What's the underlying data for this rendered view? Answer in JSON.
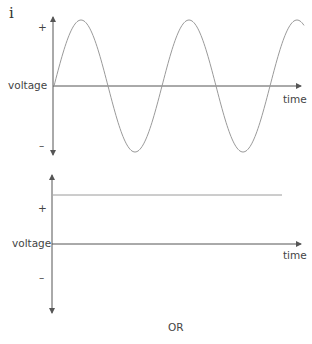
{
  "part_label": "i",
  "separator_label": "OR",
  "colors": {
    "axis": "#555555",
    "curve": "#9a9a9a",
    "text": "#444444"
  },
  "graphs": [
    {
      "id": "ac",
      "type": "sine-wave",
      "y_axis_label": "voltage",
      "x_axis_label": "time",
      "plus_label": "+",
      "minus_label": "–",
      "description": "alternating voltage varying sinusoidally with time"
    },
    {
      "id": "dc",
      "type": "constant-line",
      "y_axis_label": "voltage",
      "x_axis_label": "time",
      "plus_label": "+",
      "minus_label": "–",
      "description": "constant positive voltage over time"
    }
  ]
}
